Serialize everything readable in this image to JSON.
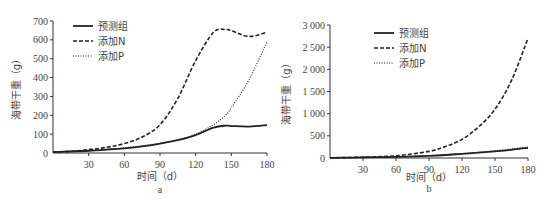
{
  "chart_data": [
    {
      "type": "line",
      "panel": "a",
      "caption": "a",
      "xlabel": "时间（d）",
      "ylabel": "海带干重（g）",
      "xlim": [
        0,
        180
      ],
      "ylim": [
        0,
        700
      ],
      "xticks": [
        0,
        30,
        60,
        90,
        120,
        150,
        180
      ],
      "yticks": [
        0,
        100,
        200,
        300,
        400,
        500,
        600,
        700
      ],
      "ytick_labels": [
        "0",
        "100",
        "200",
        "300",
        "400",
        "500",
        "600",
        "700"
      ],
      "legend_position": "upper-left",
      "grid": false,
      "x": [
        0,
        15,
        30,
        45,
        60,
        75,
        90,
        105,
        120,
        135,
        145,
        150,
        165,
        180
      ],
      "series": [
        {
          "name": "预测组",
          "style": "solid",
          "values": [
            5,
            8,
            12,
            18,
            25,
            35,
            50,
            68,
            95,
            135,
            145,
            143,
            140,
            148
          ]
        },
        {
          "name": "添加N",
          "style": "dashed",
          "values": [
            5,
            9,
            18,
            30,
            50,
            85,
            150,
            290,
            490,
            640,
            655,
            648,
            618,
            640
          ]
        },
        {
          "name": "添加P",
          "style": "dotted",
          "values": [
            5,
            8,
            13,
            20,
            28,
            38,
            52,
            70,
            100,
            150,
            200,
            240,
            390,
            590
          ]
        }
      ]
    },
    {
      "type": "line",
      "panel": "b",
      "caption": "b",
      "xlabel": "时间（d）",
      "ylabel": "海带干重（g）",
      "xlim": [
        0,
        180
      ],
      "ylim": [
        0,
        3000
      ],
      "xticks": [
        0,
        30,
        60,
        90,
        120,
        150,
        180
      ],
      "yticks": [
        0,
        500,
        1000,
        1500,
        2000,
        2500,
        3000
      ],
      "ytick_labels": [
        "0",
        "500",
        "1 000",
        "1 500",
        "2 000",
        "2 500",
        "3 000"
      ],
      "legend_position": "upper-left",
      "grid": false,
      "x": [
        0,
        30,
        60,
        90,
        105,
        120,
        135,
        150,
        165,
        180
      ],
      "series": [
        {
          "name": "预测组",
          "style": "solid",
          "values": [
            5,
            12,
            25,
            50,
            68,
            95,
            120,
            150,
            185,
            230
          ]
        },
        {
          "name": "添加N",
          "style": "dashed",
          "values": [
            5,
            18,
            50,
            150,
            260,
            420,
            700,
            1100,
            1750,
            2700
          ]
        },
        {
          "name": "添加P",
          "style": "dotted",
          "values": [
            5,
            13,
            28,
            55,
            75,
            100,
            130,
            165,
            205,
            250
          ]
        }
      ]
    }
  ]
}
